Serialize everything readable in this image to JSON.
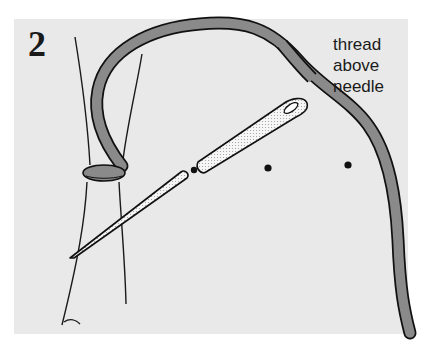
{
  "figure": {
    "step_number": "2",
    "annotation": {
      "lines": [
        "thread",
        "above",
        "needle"
      ]
    },
    "colors": {
      "background": "#e9e9e9",
      "thread_fill": "#8a8a8a",
      "outline": "#111111",
      "needle_fill": "#f4f4f4"
    }
  }
}
